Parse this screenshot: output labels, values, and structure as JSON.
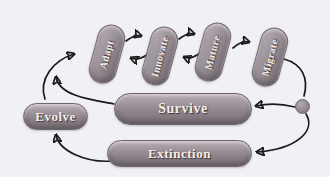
{
  "diagram": {
    "type": "cycle-flow-diagram",
    "colors": {
      "background": "#f1f0f4",
      "pill_base": "#948a91",
      "pill_highlight": "#b7aeb4",
      "pill_shadow": "#746b72",
      "pill_border": "#6f666d",
      "label_text": "#f2eee4",
      "arrow": "#1b1b1b"
    },
    "nodes": {
      "adapt": {
        "label": "Adapt"
      },
      "innovate": {
        "label": "Innovate"
      },
      "mature": {
        "label": "Mature"
      },
      "migrate": {
        "label": "Migrate"
      },
      "evolve": {
        "label": "Evolve"
      },
      "survive": {
        "label": "Survive"
      },
      "extinction": {
        "label": "Extinction"
      },
      "choice_node": {
        "label": ""
      }
    },
    "edges": [
      {
        "from": "adapt",
        "to": "innovate"
      },
      {
        "from": "innovate",
        "to": "adapt"
      },
      {
        "from": "innovate",
        "to": "mature"
      },
      {
        "from": "mature",
        "to": "innovate"
      },
      {
        "from": "mature",
        "to": "migrate"
      },
      {
        "from": "migrate",
        "to": "choice_node"
      },
      {
        "from": "choice_node",
        "to": "survive"
      },
      {
        "from": "choice_node",
        "to": "extinction"
      },
      {
        "from": "survive",
        "to": "adapt"
      },
      {
        "from": "extinction",
        "to": "evolve"
      },
      {
        "from": "evolve",
        "to": "adapt"
      }
    ]
  }
}
